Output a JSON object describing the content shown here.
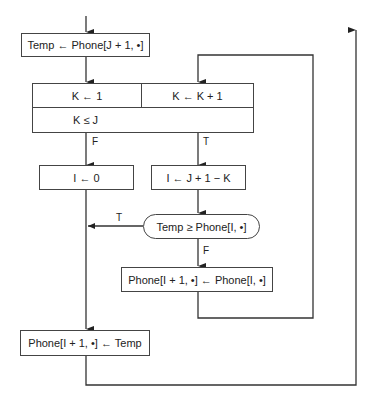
{
  "flowchart": {
    "start_box": "Temp ← Phone[J + 1, •]",
    "loop_init": "K ← 1",
    "loop_step": "K ← K + 1",
    "loop_cond": "K ≤ J",
    "false_box": "I ← 0",
    "true_box": "I ← J + 1 − K",
    "decision": "Temp ≥ Phone[I, •]",
    "shift_box": "Phone[I + 1, •] ← Phone[I, •]",
    "final_box": "Phone[I + 1, •] ← Temp",
    "labels": {
      "loop_false": "F",
      "loop_true": "T",
      "decision_true": "T",
      "decision_false": "F"
    }
  }
}
